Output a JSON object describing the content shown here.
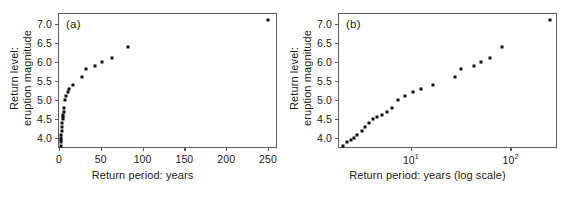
{
  "figure": {
    "background": "#ffffff",
    "point_color": "#111111",
    "axis_color": "#5d5d5d"
  },
  "panels": [
    {
      "tag": "(a)",
      "xlabel": "Return period: years",
      "ylabel_line1": "Return level:",
      "ylabel_line2": "eruption magnitude",
      "xticks": [
        "0",
        "50",
        "100",
        "150",
        "200",
        "250"
      ],
      "yticks": [
        "4.0",
        "4.5",
        "5.0",
        "5.5",
        "6.0",
        "6.5",
        "7.0"
      ]
    },
    {
      "tag": "(b)",
      "xlabel": "Return period: years (log scale)",
      "ylabel_line1": "Return level:",
      "ylabel_line2": "eruption magnitude",
      "xticks": [
        "10",
        "10"
      ],
      "xtick_exponents": [
        "1",
        "2"
      ],
      "yticks": [
        "4.0",
        "4.5",
        "5.0",
        "5.5",
        "6.0",
        "6.5",
        "7.0"
      ]
    }
  ],
  "chart_data": [
    {
      "type": "scatter",
      "title": "(a)",
      "xlabel": "Return period: years",
      "ylabel": "Return level: eruption magnitude",
      "xscale": "linear",
      "yscale": "linear",
      "xlim": [
        0,
        262
      ],
      "ylim": [
        3.72,
        7.25
      ],
      "xticks": [
        0,
        50,
        100,
        150,
        200,
        250
      ],
      "yticks": [
        4.0,
        4.5,
        5.0,
        5.5,
        6.0,
        6.5,
        7.0
      ],
      "grid": false,
      "legend": false,
      "x": [
        2.1,
        2.3,
        2.5,
        2.7,
        2.9,
        3.2,
        3.5,
        3.8,
        4.2,
        4.6,
        5.1,
        5.7,
        6.5,
        7.5,
        8.8,
        10.5,
        12.5,
        16.5,
        28,
        32,
        43,
        51,
        63,
        83,
        250
      ],
      "y": [
        3.8,
        3.9,
        3.95,
        4.0,
        4.08,
        4.2,
        4.3,
        4.4,
        4.5,
        4.55,
        4.6,
        4.7,
        4.8,
        5.0,
        5.1,
        5.2,
        5.3,
        5.4,
        5.6,
        5.8,
        5.9,
        6.0,
        6.1,
        6.4,
        7.1
      ]
    },
    {
      "type": "scatter",
      "title": "(b)",
      "xlabel": "Return period: years (log scale)",
      "ylabel": "Return level: eruption magnitude",
      "xscale": "log",
      "yscale": "linear",
      "xlim": [
        1.9,
        300
      ],
      "ylim": [
        3.72,
        7.25
      ],
      "xticks": [
        10,
        100
      ],
      "xtick_labels": [
        "10^1",
        "10^2"
      ],
      "yticks": [
        4.0,
        4.5,
        5.0,
        5.5,
        6.0,
        6.5,
        7.0
      ],
      "grid": false,
      "legend": false,
      "x": [
        2.1,
        2.3,
        2.5,
        2.7,
        2.9,
        3.2,
        3.5,
        3.8,
        4.2,
        4.6,
        5.1,
        5.7,
        6.5,
        7.5,
        8.8,
        10.5,
        12.5,
        16.5,
        28,
        32,
        43,
        51,
        63,
        83,
        250
      ],
      "y": [
        3.8,
        3.9,
        3.95,
        4.0,
        4.08,
        4.2,
        4.3,
        4.4,
        4.5,
        4.55,
        4.6,
        4.7,
        4.8,
        5.0,
        5.1,
        5.2,
        5.3,
        5.4,
        5.6,
        5.8,
        5.9,
        6.0,
        6.1,
        6.4,
        7.1
      ]
    }
  ]
}
